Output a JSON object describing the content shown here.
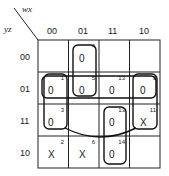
{
  "kmap": {
    "row_var": "yz",
    "col_var": "wx",
    "col_labels": [
      "00",
      "01",
      "11",
      "10"
    ],
    "row_labels": [
      "00",
      "01",
      "11",
      "10"
    ],
    "cells": [
      [
        {
          "v": "",
          "i": ""
        },
        {
          "v": "0",
          "i": "4"
        },
        {
          "v": "",
          "i": ""
        },
        {
          "v": "",
          "i": ""
        }
      ],
      [
        {
          "v": "0",
          "i": "1"
        },
        {
          "v": "0",
          "i": "5"
        },
        {
          "v": "0",
          "i": "13"
        },
        {
          "v": "0",
          "i": "9"
        }
      ],
      [
        {
          "v": "0",
          "i": "3"
        },
        {
          "v": "",
          "i": ""
        },
        {
          "v": "0",
          "i": "13"
        },
        {
          "v": "X",
          "i": "11"
        }
      ],
      [
        {
          "v": "X",
          "i": "2"
        },
        {
          "v": "X",
          "i": "6"
        },
        {
          "v": "0",
          "i": "14"
        },
        {
          "v": "",
          "i": ""
        }
      ]
    ]
  }
}
